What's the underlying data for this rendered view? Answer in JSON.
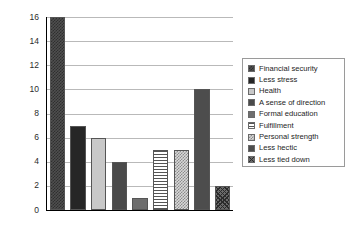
{
  "chart_data": {
    "type": "bar",
    "title": "",
    "subtitle": "",
    "xlabel": "",
    "ylabel": "",
    "categories": [
      "Financial security",
      "Less stress",
      "Health",
      "A sense of direction",
      "Formal education",
      "Fulfillment",
      "Personal strength",
      "Less hectic",
      "Less tied down"
    ],
    "values": [
      16,
      7,
      6,
      4,
      1,
      5,
      5,
      10,
      2
    ],
    "ylim": [
      0,
      16
    ],
    "ytick_step": 2,
    "ytick_labels": [
      "0",
      "2",
      "4",
      "6",
      "8",
      "10",
      "12",
      "14",
      "16"
    ],
    "xtick_labels": [],
    "grid": "horizontal",
    "legend_position": "right",
    "series": [
      {
        "name": "Financial security",
        "value": 16,
        "fill": "fill-checker-dark",
        "color": "#4f4f4f"
      },
      {
        "name": "Less stress",
        "value": 7,
        "fill": "fill-black",
        "color": "#262626"
      },
      {
        "name": "Health",
        "value": 6,
        "fill": "fill-lightgray",
        "color": "#c8c8c8"
      },
      {
        "name": "A sense of direction",
        "value": 4,
        "fill": "fill-darkgray",
        "color": "#4a4a4a"
      },
      {
        "name": "Formal education",
        "value": 1,
        "fill": "fill-midgray",
        "color": "#6e6e6e"
      },
      {
        "name": "Fulfillment",
        "value": 5,
        "fill": "fill-hstripe",
        "color": "#ffffff"
      },
      {
        "name": "Personal strength",
        "value": 5,
        "fill": "fill-checker-light",
        "color": "#d8d8d8"
      },
      {
        "name": "Less hectic",
        "value": 10,
        "fill": "fill-solid-dark2",
        "color": "#4d4d4d"
      },
      {
        "name": "Less tied down",
        "value": 2,
        "fill": "fill-crosshatch",
        "color": "#6a6a6a"
      }
    ]
  },
  "axis": {
    "line_color": "#000000",
    "grid_color": "#b9b9b9"
  },
  "legend": {
    "border_color": "#9a9a9a",
    "background": "#ffffff"
  }
}
